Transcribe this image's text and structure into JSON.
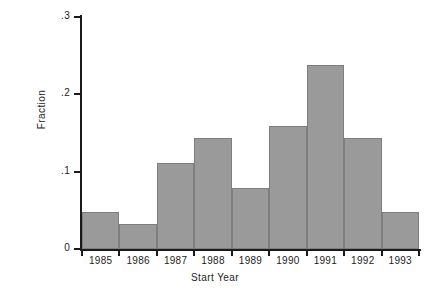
{
  "chart_data": {
    "type": "bar",
    "title": "",
    "xlabel": "Start Year",
    "ylabel": "Fraction",
    "categories": [
      "1985",
      "1986",
      "1987",
      "1988",
      "1989",
      "1990",
      "1991",
      "1992",
      "1993"
    ],
    "values": [
      0.048,
      0.032,
      0.111,
      0.143,
      0.079,
      0.159,
      0.238,
      0.143,
      0.048
    ],
    "ylim": [
      0,
      0.3
    ],
    "ytick_labels": [
      "0",
      ".1",
      ".2",
      ".3"
    ],
    "ytick_values": [
      0,
      0.1,
      0.2,
      0.3
    ],
    "xtick_labels": [
      "1985",
      "1986",
      "1987",
      "1988",
      "1989",
      "1990",
      "1991",
      "1992",
      "1993"
    ],
    "grid": false,
    "legend": "none",
    "bar_color": "#9a9a9a",
    "bar_edge_color": "#7e7e7e",
    "axis_color": "#1a1a1a",
    "background_color": "#ffffff"
  }
}
